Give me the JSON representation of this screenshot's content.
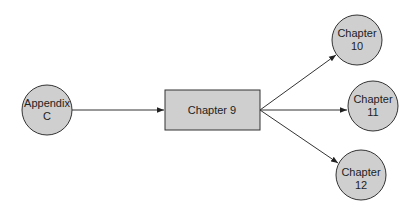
{
  "diagram": {
    "type": "flow",
    "colors": {
      "node_fill": "#cfcfcf",
      "stroke": "#333333",
      "background": "#ffffff"
    },
    "nodes": [
      {
        "id": "appendix-c",
        "shape": "circle",
        "line1": "Appendix",
        "line2": "C"
      },
      {
        "id": "chapter-9",
        "shape": "rectangle",
        "label": "Chapter 9"
      },
      {
        "id": "chapter-10",
        "shape": "circle",
        "line1": "Chapter",
        "line2": "10"
      },
      {
        "id": "chapter-11",
        "shape": "circle",
        "line1": "Chapter",
        "line2": "11"
      },
      {
        "id": "chapter-12",
        "shape": "circle",
        "line1": "Chapter",
        "line2": "12"
      }
    ],
    "edges": [
      {
        "from": "appendix-c",
        "to": "chapter-9"
      },
      {
        "from": "chapter-9",
        "to": "chapter-10"
      },
      {
        "from": "chapter-9",
        "to": "chapter-11"
      },
      {
        "from": "chapter-9",
        "to": "chapter-12"
      }
    ]
  }
}
